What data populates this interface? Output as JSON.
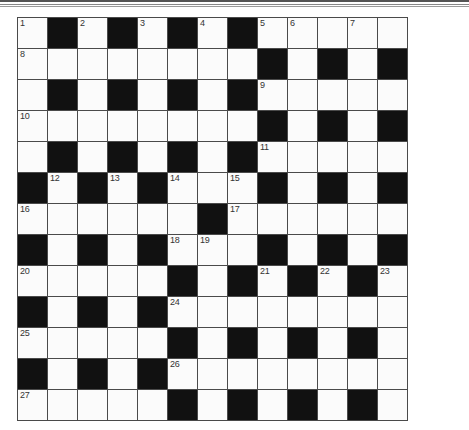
{
  "puzzle": {
    "type": "crossword",
    "rows": 13,
    "cols": 13,
    "colors": {
      "block": "#111111",
      "cell": "#fbfbfb",
      "line": "#4a4a4a",
      "number": "#333333"
    },
    "grid": [
      "W.W.W.W.WWWWW",
      "WWWWWWWW.W.W.",
      "W.W.W.W.WWWWW",
      "WWWWWWWW.W.W.",
      "W.W.W.W.WWWWW",
      ".W.W.WWW.W.W.",
      "WWWWWW.WWWWWW",
      ".W.W.WWW.W.W.",
      "WWWWW.W.W.W.W",
      ".W.W.WWWWWWWW",
      "WWWWW.W.W.W.W",
      ".W.W.WWWWWWWW",
      "WWWWW.W.W.W.W"
    ],
    "numbers": [
      {
        "row": 0,
        "col": 0,
        "n": "1"
      },
      {
        "row": 0,
        "col": 2,
        "n": "2"
      },
      {
        "row": 0,
        "col": 4,
        "n": "3"
      },
      {
        "row": 0,
        "col": 6,
        "n": "4"
      },
      {
        "row": 0,
        "col": 8,
        "n": "5"
      },
      {
        "row": 0,
        "col": 9,
        "n": "6"
      },
      {
        "row": 0,
        "col": 11,
        "n": "7"
      },
      {
        "row": 1,
        "col": 0,
        "n": "8"
      },
      {
        "row": 2,
        "col": 8,
        "n": "9"
      },
      {
        "row": 3,
        "col": 0,
        "n": "10"
      },
      {
        "row": 4,
        "col": 8,
        "n": "11"
      },
      {
        "row": 5,
        "col": 1,
        "n": "12"
      },
      {
        "row": 5,
        "col": 3,
        "n": "13"
      },
      {
        "row": 5,
        "col": 5,
        "n": "14"
      },
      {
        "row": 5,
        "col": 7,
        "n": "15"
      },
      {
        "row": 6,
        "col": 0,
        "n": "16"
      },
      {
        "row": 6,
        "col": 7,
        "n": "17"
      },
      {
        "row": 7,
        "col": 5,
        "n": "18"
      },
      {
        "row": 7,
        "col": 6,
        "n": "19"
      },
      {
        "row": 8,
        "col": 0,
        "n": "20"
      },
      {
        "row": 8,
        "col": 8,
        "n": "21"
      },
      {
        "row": 8,
        "col": 10,
        "n": "22"
      },
      {
        "row": 8,
        "col": 12,
        "n": "23"
      },
      {
        "row": 9,
        "col": 5,
        "n": "24"
      },
      {
        "row": 10,
        "col": 0,
        "n": "25"
      },
      {
        "row": 11,
        "col": 5,
        "n": "26"
      },
      {
        "row": 12,
        "col": 0,
        "n": "27"
      }
    ]
  }
}
